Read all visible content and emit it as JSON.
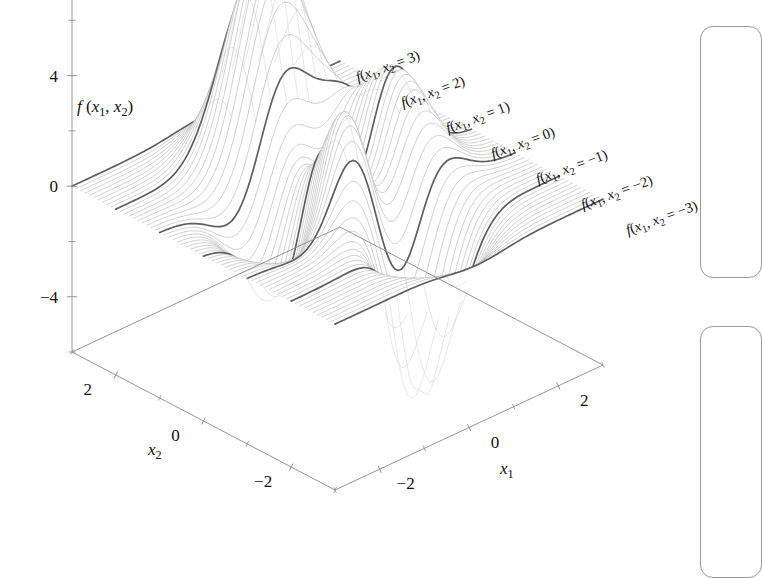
{
  "figure": {
    "kind": "3d-surface-mesh-plot",
    "background": "#ffffff",
    "mesh_color": "#b4b4b4",
    "highlight_color": "#555555",
    "axis_color": "#8a8a8a",
    "text_color": "#111111"
  },
  "axes": {
    "z": {
      "title": "f(x₁, x₂)",
      "title_f": "f",
      "title_rest": "(x",
      "ticks": [
        "8",
        "4",
        "0",
        "−4"
      ],
      "tick_values": [
        8,
        4,
        0,
        -4
      ],
      "minor_between": 1,
      "range": [
        -6,
        9
      ]
    },
    "x1": {
      "title": "x₁",
      "title_base": "x",
      "title_sub": "1",
      "ticks": [
        "−2",
        "0",
        "2"
      ],
      "tick_values": [
        -2,
        0,
        2
      ],
      "range": [
        -3,
        3
      ]
    },
    "x2": {
      "title": "x₂",
      "title_base": "x",
      "title_sub": "2",
      "ticks": [
        "2",
        "0",
        "−2"
      ],
      "tick_values": [
        2,
        0,
        -2
      ],
      "range": [
        -3,
        3
      ]
    }
  },
  "curve_labels": [
    {
      "text": "f(x₁, x₂ = 3)",
      "x2": 3
    },
    {
      "text": "f(x₁, x₂ = 2)",
      "x2": 2
    },
    {
      "text": "f(x₁, x₂ = 1)",
      "x2": 1
    },
    {
      "text": "f(x₁, x₂ = 0)",
      "x2": 0
    },
    {
      "text": "f(x₁, x₂ = −1)",
      "x2": -1
    },
    {
      "text": "f(x₁, x₂ = −2)",
      "x2": -2
    },
    {
      "text": "f(x₁, x₂ = −3)",
      "x2": -3
    }
  ],
  "chart_data": {
    "type": "surface",
    "title": "",
    "function": "peaks",
    "xlabel": "x₁",
    "ylabel": "x₂",
    "zlabel": "f(x₁, x₂)",
    "xlim": [
      -3,
      3
    ],
    "ylim": [
      -3,
      3
    ],
    "zlim": [
      -6,
      9
    ],
    "x_ticks": [
      -2,
      0,
      2
    ],
    "y_ticks": [
      -2,
      0,
      2
    ],
    "z_ticks": [
      -4,
      0,
      4,
      8
    ],
    "grid": false,
    "legend": "none",
    "highlighted_slices": [
      3,
      2,
      1,
      0,
      -1,
      -2,
      -3
    ],
    "mesh_lines_x2": 61
  },
  "panels": [
    {
      "name": "right-panel-upper"
    },
    {
      "name": "right-panel-lower"
    }
  ]
}
